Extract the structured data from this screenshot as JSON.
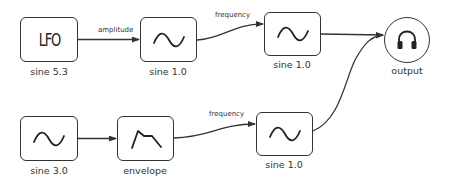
{
  "diagram": {
    "nodes": [
      {
        "id": "lfo",
        "type": "box",
        "content": "LFO",
        "label": "sine 5.3"
      },
      {
        "id": "osc1",
        "type": "box",
        "icon": "sine-wave-icon",
        "label": "sine 1.0"
      },
      {
        "id": "osc2",
        "type": "box",
        "icon": "sine-wave-icon",
        "label": "sine 1.0"
      },
      {
        "id": "output",
        "type": "circle",
        "icon": "headphones-icon",
        "label": "output"
      },
      {
        "id": "osc3",
        "type": "box",
        "icon": "sine-wave-icon",
        "label": "sine 3.0"
      },
      {
        "id": "env",
        "type": "box",
        "icon": "envelope-shape-icon",
        "label": "envelope"
      },
      {
        "id": "osc4",
        "type": "box",
        "icon": "sine-wave-icon",
        "label": "sine 1.0"
      }
    ],
    "edges": [
      {
        "from": "lfo",
        "to": "osc1",
        "label": "amplitude"
      },
      {
        "from": "osc1",
        "to": "osc2",
        "label": "frequency"
      },
      {
        "from": "osc2",
        "to": "output",
        "label": ""
      },
      {
        "from": "osc3",
        "to": "env",
        "label": ""
      },
      {
        "from": "env",
        "to": "osc4",
        "label": "frequency"
      },
      {
        "from": "osc4",
        "to": "output",
        "label": ""
      }
    ],
    "colors": {
      "stroke": "#333333",
      "background": "#ffffff"
    }
  }
}
